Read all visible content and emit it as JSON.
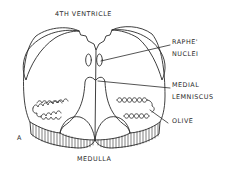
{
  "figure": {
    "panel_letter": "A",
    "title_top": "4TH VENTRICLE",
    "title_bottom": "MEDULLA",
    "line_color": "#2a2a2a",
    "background": "#ffffff"
  },
  "labels": {
    "raphe_line1": "RAPHE'",
    "raphe_line2": "NUCLEI",
    "medial_line1": "MEDIAL",
    "medial_line2": "LEMNISCUS",
    "olive": "OLIVE"
  }
}
